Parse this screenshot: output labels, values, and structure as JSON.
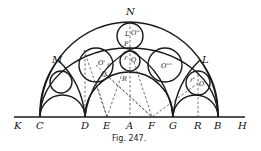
{
  "figure": {
    "caption": "Fig. 247.",
    "baseline_labels": [
      "K",
      "C",
      "D",
      "E",
      "A",
      "F",
      "G",
      "R",
      "B",
      "H"
    ],
    "point_labels": {
      "N": "N",
      "M": "M",
      "L": "L"
    },
    "circle_labels": {
      "top": "O''",
      "top_small1": "L",
      "top_small2": "P",
      "center": "O",
      "center_r": "r",
      "left": "O'",
      "left_r": "r",
      "right_big": "O'''",
      "right_small": "O",
      "right_small_r": "r'",
      "R_label": "R",
      "Q_label": "Q"
    }
  }
}
